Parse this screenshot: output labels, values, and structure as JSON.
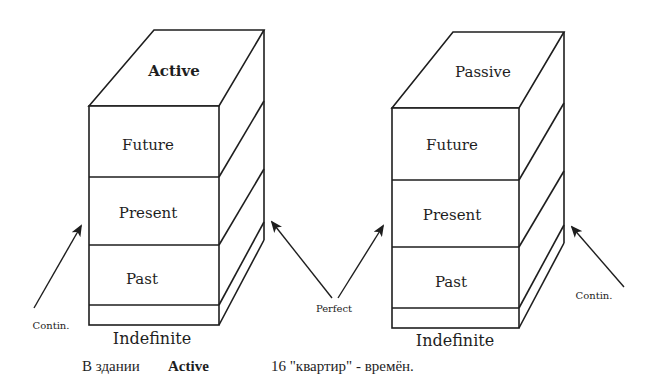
{
  "diagram": {
    "buildings": [
      {
        "roof_label": "Active",
        "floors": [
          "Future",
          "Present",
          "Past"
        ],
        "base_label": "Indefinite",
        "left_arrow_label": "Contin.",
        "right_arrow_label": "Perfect"
      },
      {
        "roof_label": "Passive",
        "floors": [
          "Future",
          "Present",
          "Past"
        ],
        "base_label": "Indefinite",
        "left_arrow_label": "Perfect",
        "right_arrow_label": "Contin."
      }
    ],
    "shared_label": "Perfect",
    "caption": {
      "prefix": "В здании",
      "bold_word": "Active",
      "rest": "16 \"квартир\" - времён."
    },
    "colors": {
      "ink": "#1e1e1e",
      "paper": "#ffffff"
    }
  }
}
